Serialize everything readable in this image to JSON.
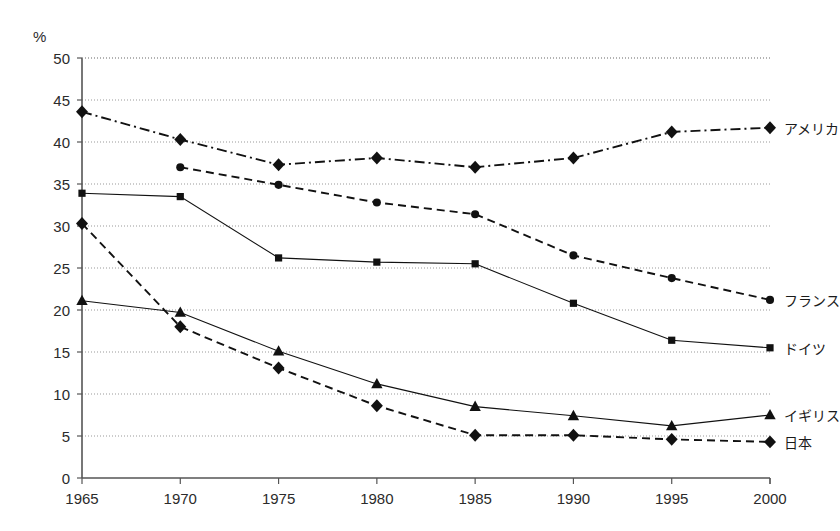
{
  "chart_data": {
    "type": "line",
    "title": "",
    "subtitle": "",
    "xlabel": "",
    "ylabel": "%",
    "unit_label": "%",
    "x": [
      1965,
      1970,
      1975,
      1980,
      1985,
      1990,
      1995,
      2000
    ],
    "categories": [
      "1965",
      "1970",
      "1975",
      "1980",
      "1985",
      "1990",
      "1995",
      "2000"
    ],
    "xlim": [
      1965,
      2000
    ],
    "ylim": [
      0,
      50
    ],
    "ytick_values": [
      0,
      5,
      10,
      15,
      20,
      25,
      30,
      35,
      40,
      45,
      50
    ],
    "ytick_labels": [
      "0",
      "5",
      "10",
      "15",
      "20",
      "25",
      "30",
      "35",
      "40",
      "45",
      "50"
    ],
    "grid": true,
    "grid_axis": "y",
    "grid_style": "dotted",
    "legend_position": "right-inline-end-of-line",
    "series": [
      {
        "name": "アメリカ",
        "name_en": "America",
        "marker": "diamond",
        "line_style": "dash-dot",
        "color": "#111111",
        "values": [
          43.6,
          40.3,
          37.3,
          38.1,
          37.0,
          38.1,
          41.2,
          41.7
        ]
      },
      {
        "name": "フランス",
        "name_en": "France",
        "marker": "circle",
        "line_style": "dashed",
        "color": "#111111",
        "values": [
          null,
          37.0,
          34.9,
          32.8,
          31.4,
          26.5,
          23.8,
          21.2
        ]
      },
      {
        "name": "ドイツ",
        "name_en": "Germany",
        "marker": "square",
        "line_style": "solid",
        "color": "#111111",
        "values": [
          33.9,
          33.5,
          26.2,
          25.7,
          25.5,
          20.8,
          16.4,
          15.5
        ]
      },
      {
        "name": "イギリス",
        "name_en": "United Kingdom",
        "marker": "triangle",
        "line_style": "solid",
        "color": "#111111",
        "values": [
          21.1,
          19.7,
          15.1,
          11.2,
          8.5,
          7.4,
          6.2,
          7.5
        ]
      },
      {
        "name": "日本",
        "name_en": "Japan",
        "marker": "diamond",
        "line_style": "dashed",
        "color": "#111111",
        "values": [
          30.3,
          18.0,
          13.1,
          8.6,
          5.1,
          5.1,
          4.6,
          4.3
        ]
      }
    ],
    "legend_entries": [
      {
        "label": "アメリカ",
        "marker": "diamond",
        "line_style": "dash-dot"
      },
      {
        "label": "フランス",
        "marker": "circle",
        "line_style": "dashed"
      },
      {
        "label": "ドイツ",
        "marker": "square",
        "line_style": "solid"
      },
      {
        "label": "イギリス",
        "marker": "triangle",
        "line_style": "solid"
      },
      {
        "label": "日本",
        "marker": "diamond",
        "line_style": "dashed"
      }
    ]
  },
  "axes": {
    "unit": "%",
    "y_labels": [
      "50",
      "45",
      "40",
      "35",
      "30",
      "25",
      "20",
      "15",
      "10",
      "5",
      "0"
    ],
    "x_labels": [
      "1965",
      "1970",
      "1975",
      "1980",
      "1985",
      "1990",
      "1995",
      "2000"
    ]
  },
  "legend": {
    "america": "アメリカ",
    "france": "フランス",
    "germany": "ドイツ",
    "uk": "イギリス",
    "japan": "日本"
  },
  "colors": {
    "ink": "#111111",
    "axis": "#555555",
    "grid": "#999999",
    "background": "#ffffff"
  }
}
